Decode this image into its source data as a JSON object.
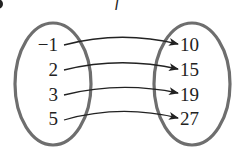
{
  "diagram": {
    "type": "mapping",
    "function_label": "f",
    "domain": [
      "−1",
      "2",
      "3",
      "5"
    ],
    "range": [
      "10",
      "15",
      "19",
      "27"
    ],
    "mappings": [
      {
        "from": "−1",
        "to": "10"
      },
      {
        "from": "2",
        "to": "15"
      },
      {
        "from": "3",
        "to": "19"
      },
      {
        "from": "5",
        "to": "27"
      }
    ],
    "colors": {
      "ellipse_stroke": "#6e6e6e",
      "arrow": "#222222",
      "text": "#222222"
    }
  }
}
